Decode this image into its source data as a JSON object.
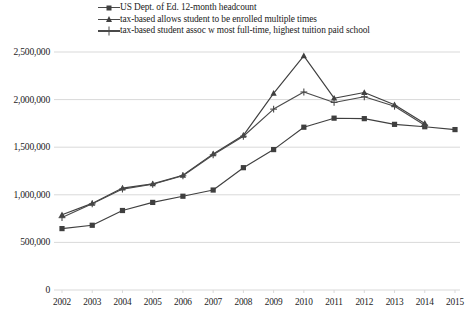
{
  "chart_data": {
    "type": "line",
    "title": "",
    "subtitle": "",
    "xlabel": "",
    "ylabel": "",
    "grid": true,
    "legend_position": "top",
    "categories": [
      "2002",
      "2003",
      "2004",
      "2005",
      "2006",
      "2007",
      "2008",
      "2009",
      "2010",
      "2011",
      "2012",
      "2013",
      "2014",
      "2015"
    ],
    "x": [
      2002,
      2003,
      2004,
      2005,
      2006,
      2007,
      2008,
      2009,
      2010,
      2011,
      2012,
      2013,
      2014,
      2015
    ],
    "ylim": [
      0,
      2500000
    ],
    "ytick_values": [
      0,
      500000,
      1000000,
      1500000,
      2000000,
      2500000
    ],
    "ytick_labels": [
      "0",
      "500,000",
      "1,000,000",
      "1,500,000",
      "2,000,000",
      "2,500,000"
    ],
    "xtick_labels": [
      "2002",
      "2003",
      "2004",
      "2005",
      "2006",
      "2007",
      "2008",
      "2009",
      "2010",
      "2011",
      "2012",
      "2013",
      "2014",
      "2015"
    ],
    "series": [
      {
        "name": "US Dept. of Ed. 12-month headcount",
        "marker": "square",
        "color": "#3f3f3f",
        "values": [
          645000,
          680000,
          835000,
          920000,
          985000,
          1050000,
          1285000,
          1475000,
          1710000,
          1805000,
          1800000,
          1740000,
          1715000,
          1685000
        ]
      },
      {
        "name": "tax-based allows student to be enrolled multiple times",
        "marker": "triangle",
        "color": "#3f3f3f",
        "values": [
          790000,
          910000,
          1070000,
          1115000,
          1205000,
          1430000,
          1625000,
          2065000,
          2460000,
          2015000,
          2075000,
          1945000,
          1750000,
          null
        ]
      },
      {
        "name": "tax-based student assoc w most full-time, highest tuition paid school",
        "marker": "cross",
        "color": "#4a4a4a",
        "values": [
          760000,
          905000,
          1060000,
          1110000,
          1200000,
          1420000,
          1615000,
          1900000,
          2080000,
          1970000,
          2030000,
          1930000,
          1730000,
          null
        ]
      }
    ]
  },
  "legend": {
    "items": [
      {
        "label": "US Dept. of Ed. 12-month headcount",
        "marker": "square"
      },
      {
        "label": "tax-based allows student to be enrolled multiple times",
        "marker": "triangle"
      },
      {
        "label": "tax-based student assoc w most full-time, highest tuition paid school",
        "marker": "cross"
      }
    ]
  },
  "colors": {
    "line": "#4a4a4a",
    "marker": "#3f3f3f",
    "grid": "#d9d9d9",
    "text": "#1c1c1c"
  }
}
